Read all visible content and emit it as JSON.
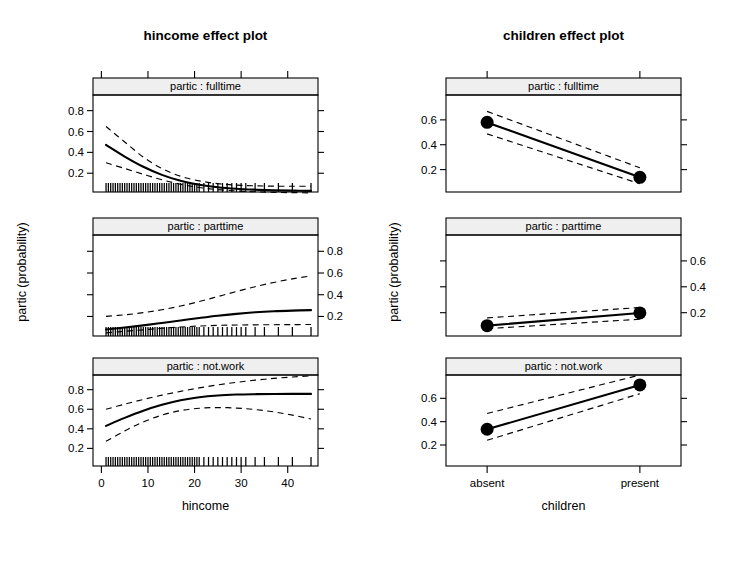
{
  "figure": {
    "panels": [
      "partic : fulltime",
      "partic : parttime",
      "partic : not.work"
    ],
    "ylabel": "partic (probability)",
    "ytick_labels": [
      "0.2",
      "0.4",
      "0.6",
      "0.8"
    ],
    "ytick_values": [
      0.2,
      0.4,
      0.6,
      0.8
    ]
  },
  "chart_data": [
    {
      "type": "line",
      "title": "hincome effect plot",
      "xlabel": "hincome",
      "ylabel": "partic (probability)",
      "xlim": [
        -1.8,
        46.5
      ],
      "ylim": [
        0.02,
        0.95
      ],
      "xtick_labels": [
        "0",
        "10",
        "20",
        "30",
        "40"
      ],
      "xtick_values": [
        0,
        10,
        20,
        30,
        40
      ],
      "ytick_labels": [
        "0.2",
        "0.4",
        "0.6",
        "0.8"
      ],
      "ytick_values": [
        0.2,
        0.4,
        0.6,
        0.8
      ],
      "grid": false,
      "legend": "none",
      "panel_var": "partic",
      "rug_values": [
        1,
        1.5,
        2,
        2.5,
        3,
        3.5,
        4,
        4.5,
        5,
        5.5,
        6,
        6.5,
        7,
        7.5,
        8,
        8.5,
        9,
        9.5,
        10,
        10.5,
        11,
        11.5,
        12,
        12.5,
        13,
        13.5,
        14,
        14.5,
        15,
        15.5,
        16,
        16.5,
        17,
        17.5,
        18,
        18.5,
        19,
        19.5,
        20,
        20.5,
        21,
        22,
        23,
        24,
        25,
        26,
        27,
        28,
        29,
        30,
        31,
        33,
        35,
        38,
        41,
        45
      ],
      "panels": [
        {
          "name": "partic : fulltime",
          "x": [
            1,
            5,
            9,
            13,
            17,
            21,
            25,
            29,
            33,
            37,
            41,
            45
          ],
          "fit": [
            0.472,
            0.36,
            0.262,
            0.184,
            0.127,
            0.09,
            0.066,
            0.051,
            0.042,
            0.036,
            0.033,
            0.031
          ],
          "lower": [
            0.3,
            0.246,
            0.19,
            0.137,
            0.094,
            0.063,
            0.043,
            0.03,
            0.022,
            0.017,
            0.014,
            0.012
          ],
          "upper": [
            0.648,
            0.5,
            0.355,
            0.245,
            0.171,
            0.127,
            0.1,
            0.086,
            0.079,
            0.076,
            0.075,
            0.075
          ]
        },
        {
          "name": "partic : parttime",
          "x": [
            1,
            5,
            9,
            13,
            17,
            21,
            25,
            29,
            33,
            37,
            41,
            45
          ],
          "fit": [
            0.08,
            0.098,
            0.118,
            0.14,
            0.163,
            0.186,
            0.207,
            0.224,
            0.238,
            0.248,
            0.254,
            0.258
          ],
          "lower": [
            0.049,
            0.063,
            0.077,
            0.091,
            0.103,
            0.112,
            0.118,
            0.121,
            0.123,
            0.124,
            0.125,
            0.126
          ],
          "upper": [
            0.201,
            0.215,
            0.235,
            0.262,
            0.296,
            0.337,
            0.383,
            0.43,
            0.474,
            0.513,
            0.546,
            0.573
          ]
        },
        {
          "name": "partic : not.work",
          "x": [
            1,
            5,
            9,
            13,
            17,
            21,
            25,
            29,
            33,
            37,
            41,
            45
          ],
          "fit": [
            0.43,
            0.512,
            0.585,
            0.645,
            0.692,
            0.723,
            0.741,
            0.75,
            0.754,
            0.756,
            0.757,
            0.757
          ],
          "lower": [
            0.272,
            0.378,
            0.47,
            0.54,
            0.586,
            0.61,
            0.617,
            0.612,
            0.597,
            0.573,
            0.54,
            0.5
          ],
          "upper": [
            0.6,
            0.652,
            0.7,
            0.744,
            0.783,
            0.818,
            0.849,
            0.875,
            0.897,
            0.915,
            0.93,
            0.941
          ]
        }
      ]
    },
    {
      "type": "line",
      "title": "children effect plot",
      "xlabel": "children",
      "ylabel": "partic (probability)",
      "categories": [
        "absent",
        "present"
      ],
      "ylim": [
        0.02,
        0.8
      ],
      "ytick_labels": [
        "0.2",
        "0.4",
        "0.6"
      ],
      "ytick_values": [
        0.2,
        0.4,
        0.6
      ],
      "grid": false,
      "legend": "none",
      "panel_var": "partic",
      "panels": [
        {
          "name": "partic : fulltime",
          "fit": [
            0.58,
            0.138
          ],
          "lower": [
            0.487,
            0.086
          ],
          "upper": [
            0.668,
            0.215
          ]
        },
        {
          "name": "partic : parttime",
          "fit": [
            0.1,
            0.198
          ],
          "lower": [
            0.076,
            0.15
          ],
          "upper": [
            0.16,
            0.24
          ]
        },
        {
          "name": "partic : not.work",
          "fit": [
            0.335,
            0.715
          ],
          "lower": [
            0.24,
            0.64
          ],
          "upper": [
            0.47,
            0.8
          ]
        }
      ]
    }
  ]
}
